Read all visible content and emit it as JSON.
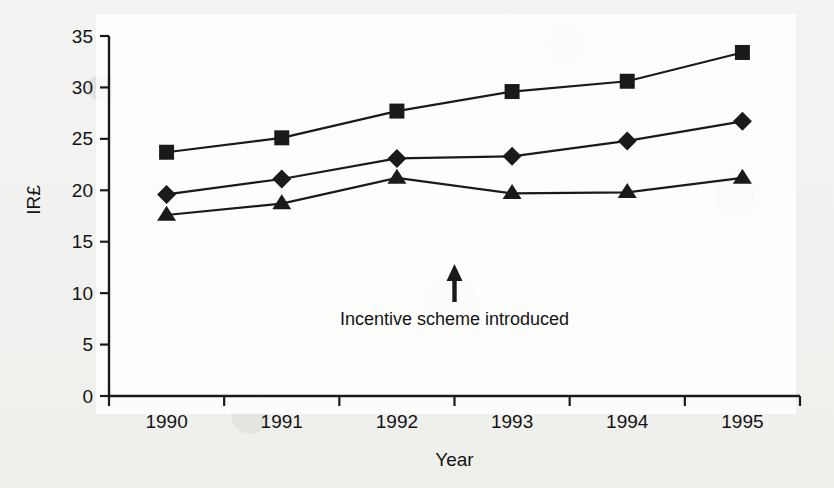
{
  "figure": {
    "width": 834,
    "height": 488,
    "background_color": "#f2f2f0",
    "ink_color": "#1a1a1a"
  },
  "chart_data": {
    "type": "line",
    "title": "",
    "subtitle": "",
    "xlabel": "Year",
    "ylabel": "IR£",
    "categories": [
      "1990",
      "1991",
      "1992",
      "1993",
      "1994",
      "1995"
    ],
    "x": [
      1990,
      1991,
      1992,
      1993,
      1994,
      1995
    ],
    "ylim": [
      0,
      35
    ],
    "yticks": [
      0,
      5,
      10,
      15,
      20,
      25,
      30,
      35
    ],
    "ytick_labels": [
      "0",
      "5",
      "10",
      "15",
      "20",
      "25",
      "30",
      "35"
    ],
    "grid": false,
    "legend": false,
    "legend_position": "none",
    "series": [
      {
        "name": "square-series",
        "marker": "square",
        "values": [
          23.7,
          25.1,
          27.7,
          29.6,
          30.6,
          33.4
        ]
      },
      {
        "name": "diamond-series",
        "marker": "diamond",
        "values": [
          19.6,
          21.1,
          23.1,
          23.3,
          24.8,
          26.7
        ]
      },
      {
        "name": "triangle-series",
        "marker": "triangle",
        "values": [
          17.6,
          18.7,
          21.2,
          19.7,
          19.8,
          21.2
        ]
      }
    ],
    "annotations": [
      {
        "text": "Incentive scheme introduced",
        "arrow": "up",
        "x_position": 1992.5,
        "y_position": 8.0
      }
    ]
  }
}
